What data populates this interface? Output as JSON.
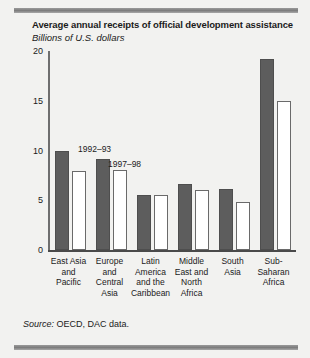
{
  "figure": {
    "title": "Average annual receipts of official development assistance",
    "subtitle": "Billions of U.S. dollars",
    "source_prefix": "Source:",
    "source_text": " OECD, DAC data."
  },
  "annotations": {
    "series_1_label": "1992–93",
    "series_2_label": "1997–98"
  },
  "colors": {
    "series_1": "#5d5d5d",
    "series_2": "#ffffff",
    "axis": "#4a4a4a",
    "background": "#f2f2f0",
    "rule": "#7d7d7d"
  },
  "axis": {
    "ticks": [
      "0",
      "5",
      "10",
      "15",
      "20"
    ]
  },
  "chart_data": {
    "type": "bar",
    "title": "Average annual receipts of official development assistance",
    "subtitle": "Billions of U.S. dollars",
    "xlabel": "",
    "ylabel": "Billions of U.S. dollars",
    "ylim": [
      0,
      20
    ],
    "yticks": [
      0,
      5,
      10,
      15,
      20
    ],
    "grid": false,
    "legend_position": "in-plot-annotation",
    "categories": [
      "East Asia and Pacific",
      "Europe and Central Asia",
      "Latin America and the Caribbean",
      "Middle East and North Africa",
      "South Asia",
      "Sub-Saharan Africa"
    ],
    "category_lines": [
      [
        "East Asia",
        "and",
        "Pacific"
      ],
      [
        "Europe",
        "and",
        "Central",
        "Asia"
      ],
      [
        "Latin",
        "America",
        "and the",
        "Caribbean"
      ],
      [
        "Middle",
        "East and",
        "North",
        "Africa"
      ],
      [
        "South",
        "Asia"
      ],
      [
        "Sub-",
        "Saharan",
        "Africa"
      ]
    ],
    "series": [
      {
        "name": "1992–93",
        "values": [
          10.0,
          9.1,
          5.5,
          6.6,
          6.1,
          19.2
        ]
      },
      {
        "name": "1997–98",
        "values": [
          7.9,
          8.0,
          5.5,
          6.0,
          4.8,
          15.0
        ]
      }
    ],
    "source": "Source: OECD, DAC data."
  }
}
